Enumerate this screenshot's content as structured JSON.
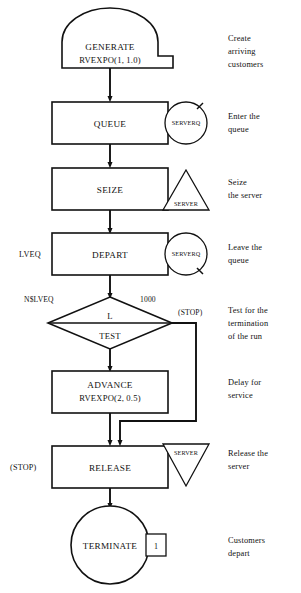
{
  "diagram": {
    "stroke_color": "#111111",
    "background_color": "#ffffff"
  },
  "blocks": {
    "generate": {
      "name": "GENERATE",
      "operands": "RVEXPO(1, 1.0)",
      "annotation_line1": "Create",
      "annotation_line2": "arriving",
      "annotation_line3": "customers"
    },
    "queue": {
      "name": "QUEUE",
      "entity": "SERVERQ",
      "annotation_line1": "Enter the",
      "annotation_line2": "queue"
    },
    "seize": {
      "name": "SEIZE",
      "entity": "SERVER",
      "annotation_line1": "Seize",
      "annotation_line2": "the server"
    },
    "depart": {
      "name": "DEPART",
      "entity": "SERVERQ",
      "left_label": "LVEQ",
      "annotation_line1": "Leave the",
      "annotation_line2": "queue"
    },
    "test": {
      "name": "TEST",
      "relation": "L",
      "left_operand": "N$LVEQ",
      "right_operand": "1000",
      "exit_label": "(STOP)",
      "annotation_line1": "Test for the",
      "annotation_line2": "termination",
      "annotation_line3": "of the run"
    },
    "advance": {
      "name": "ADVANCE",
      "operands": "RVEXPO(2, 0.5)",
      "annotation_line1": "Delay for",
      "annotation_line2": "service"
    },
    "release": {
      "name": "RELEASE",
      "entity": "SERVER",
      "left_label": "(STOP)",
      "annotation_line1": "Release the",
      "annotation_line2": "server"
    },
    "terminate": {
      "name": "TERMINATE",
      "count": "1",
      "annotation_line1": "Customers",
      "annotation_line2": "depart"
    }
  }
}
